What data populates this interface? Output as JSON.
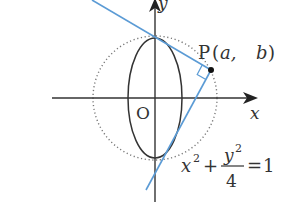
{
  "figure": {
    "axes": {
      "x_label": "x",
      "y_label": "y",
      "origin_label": "O"
    },
    "point": {
      "name": "P",
      "open": "(",
      "coord_a": "a,",
      "coord_b": "b",
      "close": ")"
    },
    "equation": {
      "x_term": "x",
      "x_exp": "2",
      "plus": "+",
      "numerator": "y",
      "num_exp": "2",
      "denominator": "4",
      "equals": "=",
      "rhs": "1"
    },
    "colors": {
      "tangent_lines": "#5b9bd5",
      "curves": "#333333",
      "axes": "#333333",
      "circle": "#777777"
    }
  }
}
